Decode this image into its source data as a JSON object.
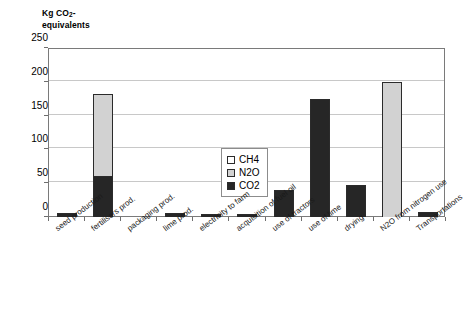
{
  "chart_data": {
    "type": "bar",
    "subtype": "stacked-vertical",
    "title": "",
    "ylabel": "Kg CO2-equivalents",
    "ylabel_parts": {
      "prefix": "Kg CO",
      "sub": "2",
      "suffix": "-",
      "line2": "equivalents"
    },
    "xlabel": "",
    "ylim": [
      0,
      250
    ],
    "yticks": [
      0,
      50,
      100,
      150,
      200,
      250
    ],
    "ytick_labels": [
      "0",
      "50",
      "100",
      "150",
      "200",
      "250"
    ],
    "grid": true,
    "grid_axis": "y",
    "legend_position": "center-left-inside",
    "categories": [
      "seed production",
      "fertilisers prod.",
      "packaging prod.",
      "lime prod.",
      "electricity to farm",
      "acquisition of fuel oil",
      "use of tractors",
      "use of lime",
      "drying",
      "N2O from nitrogen use",
      "Transportations"
    ],
    "series": [
      {
        "name": "CO2",
        "color": "#262626",
        "values": [
          6,
          60,
          0,
          6,
          5,
          5,
          40,
          174,
          47,
          0,
          7
        ]
      },
      {
        "name": "N2O",
        "color": "#d2d2d2",
        "values": [
          0,
          124,
          0,
          0,
          0,
          0,
          0,
          0,
          0,
          199,
          0
        ]
      },
      {
        "name": "CH4",
        "color": "#ffffff",
        "values": [
          0,
          0,
          0,
          0,
          0,
          0,
          0,
          0,
          0,
          0,
          0
        ]
      }
    ],
    "stack_order_bottom_to_top": [
      "CO2",
      "N2O",
      "CH4"
    ],
    "totals": [
      6,
      184,
      0,
      6,
      5,
      5,
      40,
      174,
      47,
      199,
      7
    ]
  },
  "legend": {
    "entries": [
      {
        "label": "CH4",
        "key": "ch4"
      },
      {
        "label": "N2O",
        "key": "n2o"
      },
      {
        "label": "CO2",
        "key": "co2"
      }
    ]
  },
  "colors": {
    "co2": "#262626",
    "n2o": "#d2d2d2",
    "ch4": "#ffffff",
    "grid": "#c8c8c8",
    "axis": "#7a7a7a",
    "background": "#ffffff"
  }
}
